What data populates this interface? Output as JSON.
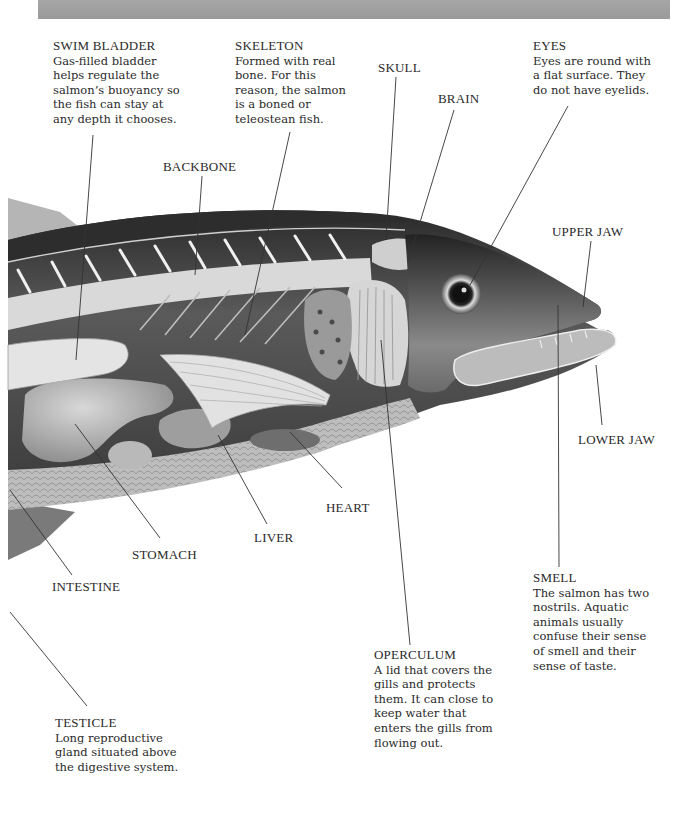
{
  "diagram": {
    "banner_color": "#a0a0a0",
    "callouts": [
      {
        "id": "swim-bladder",
        "title": "SWIM BLADDER",
        "description": "Gas-filled bladder\nhelps regulate the\nsalmon’s buoyancy so\nthe fish can stay at\nany depth it chooses."
      },
      {
        "id": "skeleton",
        "title": "SKELETON",
        "description": "Formed with real\nbone.  For this\nreason, the salmon\nis a boned or\nteleostean fish."
      },
      {
        "id": "eyes",
        "title": "EYES",
        "description": "Eyes are round with\na flat surface.  They\ndo not have eyelids."
      },
      {
        "id": "smell",
        "title": "SMELL",
        "description": "The salmon has two\nnostrils.  Aquatic\nanimals usually\nconfuse their sense\nof smell and their\nsense of taste."
      },
      {
        "id": "operculum",
        "title": "OPERCULUM",
        "description": "A lid that covers the\ngills and protects\nthem.  It can close to\nkeep water that\nenters the gills from\nflowing out."
      },
      {
        "id": "testicle",
        "title": "TESTICLE",
        "description": "Long reproductive\ngland situated above\nthe digestive system."
      }
    ],
    "labels": {
      "skull": "SKULL",
      "brain": "BRAIN",
      "backbone": "BACKBONE",
      "upper_jaw": "UPPER JAW",
      "lower_jaw": "LOWER JAW",
      "heart": "HEART",
      "liver": "LIVER",
      "stomach": "STOMACH",
      "intestine": "INTESTINE"
    }
  }
}
